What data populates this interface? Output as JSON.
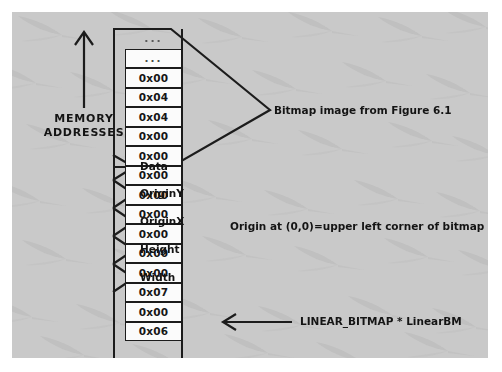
{
  "figure": {
    "background_color": "#c9c9c9",
    "ink_color": "#1c1c1c",
    "cell_fill_color": "#fbfbfb"
  },
  "memory_axis": {
    "title_line1": "MEMORY",
    "title_line2": "ADDRESSES",
    "arrow_direction": "up",
    "arrow_icon": "up-arrow-icon"
  },
  "memory_column": {
    "cells": [
      {
        "value": "..."
      },
      {
        "value": "..."
      },
      {
        "value": "0x00"
      },
      {
        "value": "0x04"
      },
      {
        "value": "0x04"
      },
      {
        "value": "0x00"
      },
      {
        "value": "0x00"
      },
      {
        "value": "0x00"
      },
      {
        "value": "0x00"
      },
      {
        "value": "0x00"
      },
      {
        "value": "0x00"
      },
      {
        "value": "0x00"
      },
      {
        "value": "0x00"
      },
      {
        "value": "0x07"
      },
      {
        "value": "0x00"
      },
      {
        "value": "0x06"
      }
    ]
  },
  "field_labels": {
    "data": "Data",
    "origin_y": "OriginY",
    "origin_x": "OriginX",
    "height": "Height",
    "width": "Width"
  },
  "annotations": {
    "bitmap_image": "Bitmap image from Figure 6.1",
    "origin_note": "Origin at (0,0)=upper left corner of bitmap",
    "pointer_label": "LINEAR_BITMAP * LinearBM"
  }
}
